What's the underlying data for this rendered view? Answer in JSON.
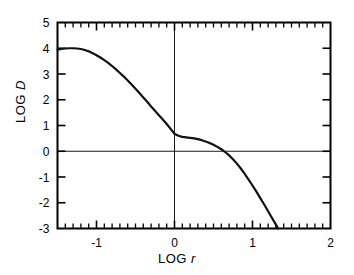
{
  "chart_data": {
    "type": "line",
    "title": "",
    "xlabel": "LOG r",
    "ylabel": "LOG D",
    "xlim": [
      -1.5,
      2
    ],
    "ylim": [
      -3,
      5
    ],
    "grid": false,
    "legend": null,
    "x_ticks_major": [
      -1,
      0,
      1,
      2
    ],
    "x_ticklabels": [
      "-1",
      "0",
      "1",
      "2"
    ],
    "y_ticks_major": [
      -3,
      -2,
      -1,
      0,
      1,
      2,
      3,
      4,
      5
    ],
    "y_ticklabels": [
      "-3",
      "-2",
      "-1",
      "0",
      "1",
      "2",
      "3",
      "4",
      "5"
    ],
    "x_minor_tick_step": 0.1,
    "zero_lines": {
      "vertical_x": 0,
      "horizontal_y": 0
    },
    "series": [
      {
        "name": "LOG D vs LOG r",
        "x": [
          -1.5,
          -1.45,
          -1.4,
          -1.35,
          -1.3,
          -1.25,
          -1.2,
          -1.15,
          -1.1,
          -1.05,
          -1.0,
          -0.95,
          -0.9,
          -0.85,
          -0.8,
          -0.75,
          -0.7,
          -0.65,
          -0.6,
          -0.55,
          -0.5,
          -0.45,
          -0.4,
          -0.35,
          -0.3,
          -0.25,
          -0.2,
          -0.15,
          -0.1,
          -0.05,
          0.0,
          0.05,
          0.1,
          0.15,
          0.2,
          0.25,
          0.3,
          0.35,
          0.4,
          0.45,
          0.5,
          0.55,
          0.6,
          0.65,
          0.7,
          0.75,
          0.8,
          0.85,
          0.9,
          0.95,
          1.0,
          1.05,
          1.1,
          1.15,
          1.2,
          1.25,
          1.3,
          1.33
        ],
        "y": [
          3.95,
          3.97,
          3.99,
          4.0,
          4.0,
          3.99,
          3.97,
          3.93,
          3.88,
          3.81,
          3.73,
          3.64,
          3.54,
          3.43,
          3.31,
          3.18,
          3.04,
          2.9,
          2.75,
          2.59,
          2.43,
          2.26,
          2.09,
          1.92,
          1.74,
          1.57,
          1.4,
          1.23,
          1.06,
          0.87,
          0.68,
          0.6,
          0.56,
          0.54,
          0.52,
          0.5,
          0.47,
          0.43,
          0.38,
          0.32,
          0.25,
          0.17,
          0.08,
          -0.03,
          -0.16,
          -0.31,
          -0.48,
          -0.67,
          -0.88,
          -1.1,
          -1.33,
          -1.57,
          -1.82,
          -2.07,
          -2.33,
          -2.59,
          -2.85,
          -3.0
        ]
      }
    ]
  },
  "axes": {
    "y_axis_label": "LOG ",
    "y_axis_label_var": "D",
    "x_axis_label": "LOG ",
    "x_axis_label_var": "r"
  }
}
